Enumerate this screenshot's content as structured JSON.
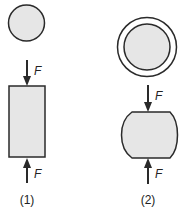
{
  "diagram": {
    "colors": {
      "stroke": "#2a2a2a",
      "fill": "#e6e6e6",
      "background": "#ffffff"
    },
    "figure1": {
      "label": "(1)",
      "top_view": "circle",
      "side_view": "rectangle",
      "force_top_label": "F",
      "force_bottom_label": "F"
    },
    "figure2": {
      "label": "(2)",
      "top_view": "double-circle",
      "side_view": "barrel",
      "force_top_label": "F",
      "force_bottom_label": "F"
    }
  }
}
